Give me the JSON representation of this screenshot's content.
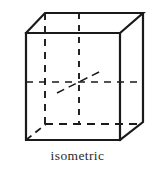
{
  "figure": {
    "caption": "isometric",
    "shape_name": "cube",
    "projection": "isometric",
    "background_color": "#ffffff",
    "line_color": "#1a1a1a",
    "caption_color": "#2b2b2b",
    "canvas": {
      "width": 155,
      "height": 172
    },
    "geometry": {
      "front_face": {
        "top_left": [
          26,
          33
        ],
        "top_right": [
          120,
          33
        ],
        "bottom_right": [
          120,
          140
        ],
        "bottom_left": [
          26,
          140
        ]
      },
      "back_face_offset": [
        23,
        -20
      ],
      "back_face": {
        "top_left": [
          45,
          13
        ],
        "top_right": [
          143,
          13
        ],
        "bottom_right": [
          143,
          122
        ],
        "bottom_left": [
          45,
          124
        ]
      },
      "hidden_vertex_center": [
        79,
        82
      ]
    },
    "visible_edges": [
      {
        "name": "front-top-edge",
        "from": [
          26,
          33
        ],
        "to": [
          120,
          33
        ]
      },
      {
        "name": "front-left-edge",
        "from": [
          26,
          33
        ],
        "to": [
          26,
          140
        ]
      },
      {
        "name": "front-right-edge",
        "from": [
          120,
          33
        ],
        "to": [
          120,
          140
        ]
      },
      {
        "name": "front-bottom-edge",
        "from": [
          26,
          140
        ],
        "to": [
          120,
          140
        ]
      },
      {
        "name": "top-left-receding-edge",
        "from": [
          26,
          33
        ],
        "to": [
          45,
          13
        ]
      },
      {
        "name": "top-right-receding-edge",
        "from": [
          120,
          33
        ],
        "to": [
          143,
          13
        ]
      },
      {
        "name": "back-top-edge",
        "from": [
          45,
          13
        ],
        "to": [
          143,
          13
        ]
      },
      {
        "name": "back-right-vertical-edge",
        "from": [
          143,
          13
        ],
        "to": [
          143,
          122
        ]
      },
      {
        "name": "bottom-right-receding-edge",
        "from": [
          120,
          140
        ],
        "to": [
          143,
          122
        ]
      }
    ],
    "hidden_edges": [
      {
        "name": "hidden-back-left-vertical",
        "from": [
          45,
          13
        ],
        "to": [
          45,
          124
        ]
      },
      {
        "name": "hidden-center-vertical",
        "from": [
          79,
          13
        ],
        "to": [
          79,
          124
        ]
      },
      {
        "name": "hidden-horizontal-mid-edge",
        "from": [
          26,
          82
        ],
        "to": [
          143,
          82
        ]
      },
      {
        "name": "hidden-bottom-back-edge",
        "from": [
          45,
          124
        ],
        "to": [
          143,
          124
        ]
      },
      {
        "name": "hidden-bottom-left-receding",
        "from": [
          26,
          140
        ],
        "to": [
          45,
          124
        ]
      },
      {
        "name": "hidden-diagonal-receding",
        "from": [
          57,
          93
        ],
        "to": [
          101,
          71
        ]
      }
    ]
  }
}
